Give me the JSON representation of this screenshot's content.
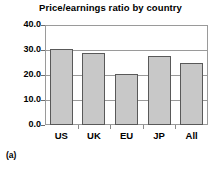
{
  "figure": {
    "label": "(a)",
    "title": "Price/earnings ratio by country"
  },
  "chart_data": {
    "type": "bar",
    "title": "Price/earnings ratio by country",
    "xlabel": "",
    "ylabel": "",
    "categories": [
      "US",
      "UK",
      "EU",
      "JP",
      "All"
    ],
    "values": [
      30.5,
      28.8,
      20.4,
      27.6,
      25.0
    ],
    "ylim": [
      0.0,
      40.0
    ],
    "ytick_values": [
      0.0,
      10.0,
      20.0,
      30.0,
      40.0
    ],
    "ytick_labels": [
      "0.0",
      "10.0",
      "20.0",
      "30.0",
      "40.0"
    ],
    "grid": true,
    "grid_axis": "y",
    "legend": false,
    "legend_position": "none",
    "bar_fill_color": "#c8c8c8",
    "bar_edge_color": "#595959",
    "grid_color": "#9a9a9a",
    "frame_color": "#9a9a9a",
    "text_color": "#000000",
    "background_color": "#ffffff"
  }
}
